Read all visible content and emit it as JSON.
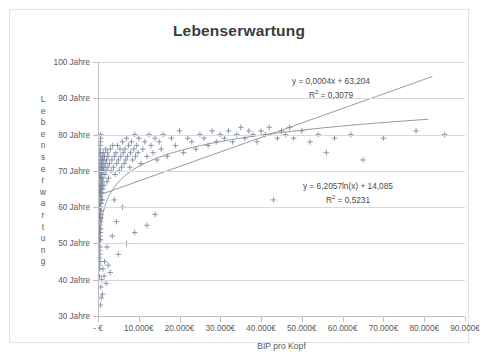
{
  "chart_data": {
    "type": "scatter",
    "title": "Lebenserwartung",
    "xlabel": "BIP pro Kopf",
    "ylabel": "Lebenserwartung",
    "xlim": [
      0,
      90000
    ],
    "ylim": [
      30,
      100
    ],
    "grid": true,
    "legend": "none",
    "marker": "plus",
    "marker_color": "#7a87a0",
    "trendline_color": "#8c8c8c",
    "x_ticks": [
      0,
      10000,
      20000,
      30000,
      40000,
      50000,
      60000,
      70000,
      80000,
      90000
    ],
    "x_tick_labels": [
      "-  €",
      "10.000€",
      "20.000€",
      "30.000€",
      "40.000€",
      "50.000€",
      "60.000€",
      "70.000€",
      "80.000€",
      "90.000€"
    ],
    "y_ticks": [
      30,
      40,
      50,
      60,
      70,
      80,
      90,
      100
    ],
    "y_tick_labels": [
      "30 Jahre",
      "40 Jahre",
      "50 Jahre",
      "60 Jahre",
      "70 Jahre",
      "80 Jahre",
      "90 Jahre",
      "100 Jahre"
    ],
    "annotations": [
      {
        "name": "linear-trendline-equation",
        "equation": "y = 0,0004x + 63,204",
        "r_squared_label": "R",
        "r_squared_exp": "2",
        "r_squared_value": " = 0,3079"
      },
      {
        "name": "logarithmic-trendline-equation",
        "equation": "y = 6,2057ln(x) + 14,085",
        "r_squared_label": "R",
        "r_squared_exp": "2",
        "r_squared_value": " = 0,5231"
      }
    ],
    "trendlines": [
      {
        "name": "linear",
        "type": "linear",
        "slope": 0.0004,
        "intercept": 63.204,
        "r2": 0.3079
      },
      {
        "name": "logarithmic",
        "type": "log",
        "coefficient": 6.2057,
        "intercept": 14.085,
        "r2": 0.5231
      }
    ],
    "points": [
      [
        300,
        44
      ],
      [
        320,
        48
      ],
      [
        340,
        51
      ],
      [
        350,
        41
      ],
      [
        360,
        55
      ],
      [
        380,
        46
      ],
      [
        400,
        58
      ],
      [
        410,
        50
      ],
      [
        420,
        61
      ],
      [
        430,
        43
      ],
      [
        440,
        54
      ],
      [
        450,
        63
      ],
      [
        460,
        47
      ],
      [
        470,
        57
      ],
      [
        480,
        52
      ],
      [
        500,
        65
      ],
      [
        510,
        45
      ],
      [
        520,
        59
      ],
      [
        530,
        49
      ],
      [
        540,
        66
      ],
      [
        550,
        53
      ],
      [
        560,
        62
      ],
      [
        570,
        56
      ],
      [
        580,
        68
      ],
      [
        600,
        51
      ],
      [
        610,
        60
      ],
      [
        620,
        64
      ],
      [
        640,
        58
      ],
      [
        650,
        69
      ],
      [
        660,
        54
      ],
      [
        680,
        63
      ],
      [
        700,
        67
      ],
      [
        710,
        57
      ],
      [
        730,
        70
      ],
      [
        750,
        61
      ],
      [
        760,
        65
      ],
      [
        780,
        59
      ],
      [
        800,
        71
      ],
      [
        820,
        66
      ],
      [
        840,
        62
      ],
      [
        860,
        68
      ],
      [
        880,
        72
      ],
      [
        900,
        64
      ],
      [
        920,
        69
      ],
      [
        950,
        73
      ],
      [
        980,
        66
      ],
      [
        1000,
        70
      ],
      [
        1020,
        62
      ],
      [
        1050,
        74
      ],
      [
        1080,
        67
      ],
      [
        1100,
        71
      ],
      [
        1150,
        65
      ],
      [
        1200,
        72
      ],
      [
        1250,
        68
      ],
      [
        1300,
        75
      ],
      [
        1350,
        70
      ],
      [
        1400,
        73
      ],
      [
        1450,
        66
      ],
      [
        1500,
        71
      ],
      [
        1600,
        74
      ],
      [
        1700,
        69
      ],
      [
        1800,
        72
      ],
      [
        1900,
        76
      ],
      [
        2000,
        70
      ],
      [
        2100,
        73
      ],
      [
        2200,
        67
      ],
      [
        2300,
        75
      ],
      [
        2400,
        71
      ],
      [
        2500,
        74
      ],
      [
        2600,
        68
      ],
      [
        2800,
        72
      ],
      [
        3000,
        76
      ],
      [
        3200,
        70
      ],
      [
        3400,
        73
      ],
      [
        3600,
        77
      ],
      [
        3800,
        71
      ],
      [
        4000,
        74
      ],
      [
        4200,
        69
      ],
      [
        4400,
        75
      ],
      [
        4600,
        72
      ],
      [
        4800,
        77
      ],
      [
        5000,
        73
      ],
      [
        5200,
        70
      ],
      [
        5400,
        76
      ],
      [
        5600,
        74
      ],
      [
        5800,
        71
      ],
      [
        6000,
        78
      ],
      [
        6200,
        75
      ],
      [
        6400,
        72
      ],
      [
        6600,
        76
      ],
      [
        6800,
        73
      ],
      [
        7000,
        79
      ],
      [
        7200,
        74
      ],
      [
        7500,
        77
      ],
      [
        7800,
        71
      ],
      [
        8000,
        75
      ],
      [
        8200,
        78
      ],
      [
        8500,
        73
      ],
      [
        8800,
        76
      ],
      [
        9000,
        80
      ],
      [
        9200,
        74
      ],
      [
        9500,
        77
      ],
      [
        9800,
        75
      ],
      [
        10000,
        79
      ],
      [
        10500,
        72
      ],
      [
        11000,
        76
      ],
      [
        11500,
        78
      ],
      [
        12000,
        74
      ],
      [
        12500,
        80
      ],
      [
        13000,
        77
      ],
      [
        13500,
        75
      ],
      [
        14000,
        79
      ],
      [
        14500,
        73
      ],
      [
        15000,
        78
      ],
      [
        15500,
        76
      ],
      [
        16000,
        80
      ],
      [
        17000,
        74
      ],
      [
        18000,
        79
      ],
      [
        19000,
        77
      ],
      [
        20000,
        81
      ],
      [
        21000,
        75
      ],
      [
        22000,
        79
      ],
      [
        23000,
        78
      ],
      [
        24000,
        76
      ],
      [
        25000,
        80
      ],
      [
        26000,
        79
      ],
      [
        27000,
        77
      ],
      [
        28000,
        81
      ],
      [
        29000,
        78
      ],
      [
        30000,
        80
      ],
      [
        31000,
        79
      ],
      [
        32000,
        81
      ],
      [
        33000,
        78
      ],
      [
        34000,
        80
      ],
      [
        35000,
        82
      ],
      [
        36000,
        79
      ],
      [
        37000,
        81
      ],
      [
        38000,
        80
      ],
      [
        39000,
        78
      ],
      [
        40000,
        81
      ],
      [
        41000,
        80
      ],
      [
        42000,
        82
      ],
      [
        43000,
        62
      ],
      [
        44000,
        79
      ],
      [
        45000,
        81
      ],
      [
        46000,
        80
      ],
      [
        47000,
        82
      ],
      [
        48000,
        79
      ],
      [
        50000,
        81
      ],
      [
        52000,
        78
      ],
      [
        54000,
        80
      ],
      [
        56000,
        75
      ],
      [
        58000,
        79
      ],
      [
        62000,
        80
      ],
      [
        65000,
        73
      ],
      [
        70000,
        79
      ],
      [
        78000,
        81
      ],
      [
        85000,
        80
      ],
      [
        700,
        38
      ],
      [
        900,
        40
      ],
      [
        1100,
        36
      ],
      [
        1500,
        41
      ],
      [
        2000,
        39
      ],
      [
        2500,
        44
      ],
      [
        3000,
        42
      ],
      [
        5000,
        47
      ],
      [
        7000,
        50
      ],
      [
        9000,
        53
      ],
      [
        12000,
        55
      ],
      [
        14000,
        58
      ],
      [
        4000,
        62
      ],
      [
        600,
        33
      ],
      [
        800,
        35
      ],
      [
        1200,
        43
      ],
      [
        1600,
        45
      ],
      [
        2200,
        49
      ],
      [
        3500,
        52
      ],
      [
        4500,
        56
      ],
      [
        6000,
        60
      ],
      [
        400,
        70
      ],
      [
        450,
        72
      ],
      [
        500,
        74
      ],
      [
        550,
        76
      ],
      [
        600,
        78
      ],
      [
        650,
        79
      ],
      [
        350,
        66
      ],
      [
        380,
        64
      ],
      [
        420,
        68
      ],
      [
        480,
        75
      ],
      [
        520,
        77
      ],
      [
        560,
        73
      ],
      [
        620,
        80
      ],
      [
        330,
        57
      ],
      [
        360,
        53
      ],
      [
        390,
        60
      ],
      [
        430,
        65
      ],
      [
        470,
        69
      ],
      [
        510,
        71
      ],
      [
        590,
        75
      ]
    ]
  }
}
